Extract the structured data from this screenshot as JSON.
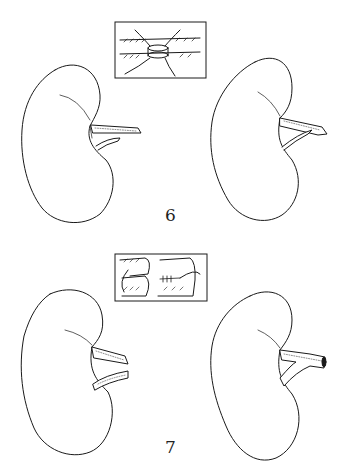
{
  "figures": [
    {
      "label": "6",
      "description": "Two kidneys with ureteral anastomosis detail",
      "inset": "end-to-end vessel anastomosis detail",
      "left_kidney": "kidney with two separate vessels",
      "right_kidney": "kidney with joined vessels"
    },
    {
      "label": "7",
      "description": "Two kidneys with side-to-side vessel anastomosis detail",
      "inset": "side-to-side vessel anastomosis with sutures",
      "left_kidney": "kidney with two separate vessels",
      "right_kidney": "kidney with Y-joined vessel"
    }
  ],
  "colors": {
    "line": "#1a1a1a",
    "background": "#ffffff"
  }
}
